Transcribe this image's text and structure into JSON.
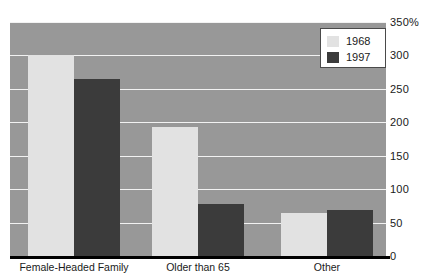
{
  "chart_data": {
    "type": "bar",
    "title": "",
    "subtitle": "",
    "xlabel": "",
    "ylabel": "",
    "ylim": [
      0,
      350
    ],
    "y_unit_suffix": "%",
    "grid": true,
    "legend_position": "top-right",
    "categories": [
      "Female-Headed Family",
      "Older than 65",
      "Other"
    ],
    "yticks": [
      "350%",
      "300",
      "250",
      "200",
      "150",
      "100",
      "50",
      "0"
    ],
    "ytick_values": [
      350,
      300,
      250,
      200,
      150,
      100,
      50,
      0
    ],
    "series": [
      {
        "name": "1968",
        "color": "#e2e2e2",
        "values": [
          300,
          193,
          64
        ]
      },
      {
        "name": "1997",
        "color": "#3b3b3b",
        "values": [
          265,
          78,
          69
        ]
      }
    ]
  },
  "legend": {
    "items": [
      {
        "label": "1968",
        "swatch": "light"
      },
      {
        "label": "1997",
        "swatch": "dark"
      }
    ]
  },
  "colors": {
    "plot_background": "#989898",
    "gridline": "#f2f2f2",
    "axis": "#000000",
    "series_1968": "#e2e2e2",
    "series_1997": "#3b3b3b",
    "text": "#1a1a1a"
  }
}
